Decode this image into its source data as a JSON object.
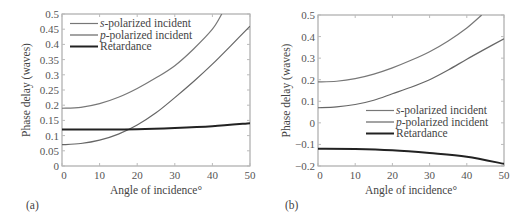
{
  "chart_data": [
    {
      "type": "line",
      "panel_label": "(a)",
      "title": "",
      "xlabel": "Angle of incidence°",
      "ylabel": "Phase delay (waves)",
      "xlim": [
        0,
        50
      ],
      "ylim": [
        0,
        0.5
      ],
      "xticks": [
        0,
        10,
        20,
        30,
        40,
        50
      ],
      "yticks": [
        0,
        0.05,
        0.1,
        0.15,
        0.2,
        0.25,
        0.3,
        0.35,
        0.4,
        0.45,
        0.5
      ],
      "ytick_labels": [
        "0",
        "0.05",
        "0.1",
        "0.15",
        "0.2",
        "0.25",
        "0.3",
        "0.35",
        "0.4",
        "0.45",
        "0.5"
      ],
      "legend_position": "upper left",
      "grid": false,
      "series": [
        {
          "name": "s-polarized incident",
          "italic_prefix": "s",
          "suffix": "-polarized incident",
          "color": "#777777",
          "width": 1.2,
          "x": [
            0,
            5,
            10,
            15,
            20,
            25,
            30,
            35,
            40,
            42.5
          ],
          "y": [
            0.19,
            0.193,
            0.205,
            0.226,
            0.255,
            0.29,
            0.33,
            0.385,
            0.45,
            0.5
          ]
        },
        {
          "name": "p-polarized incident",
          "italic_prefix": "p",
          "suffix": "-polarized incident",
          "color": "#666666",
          "width": 1.2,
          "x": [
            0,
            5,
            10,
            15,
            20,
            25,
            30,
            35,
            40,
            45,
            50
          ],
          "y": [
            0.07,
            0.074,
            0.085,
            0.105,
            0.135,
            0.175,
            0.225,
            0.278,
            0.335,
            0.397,
            0.46
          ]
        },
        {
          "name": "Retardance",
          "italic_prefix": "",
          "suffix": "Retardance",
          "color": "#222222",
          "width": 2,
          "x": [
            0,
            10,
            20,
            30,
            40,
            50
          ],
          "y": [
            0.12,
            0.12,
            0.121,
            0.125,
            0.131,
            0.141
          ]
        }
      ]
    },
    {
      "type": "line",
      "panel_label": "(b)",
      "title": "",
      "xlabel": "Angle of incidence°",
      "ylabel": "Phase delay (waves)",
      "xlim": [
        0,
        50
      ],
      "ylim": [
        -0.2,
        0.5
      ],
      "xticks": [
        0,
        10,
        20,
        30,
        40,
        50
      ],
      "yticks": [
        -0.2,
        -0.1,
        0,
        0.1,
        0.2,
        0.3,
        0.4,
        0.5
      ],
      "ytick_labels": [
        "−0.2",
        "−0.1",
        "0",
        "0.1",
        "0.2",
        "0.3",
        "0.4",
        "0.5"
      ],
      "legend_position": "lower right",
      "grid": false,
      "series": [
        {
          "name": "s-polarized incident",
          "italic_prefix": "s",
          "suffix": "-polarized incident",
          "color": "#777777",
          "width": 1.2,
          "x": [
            0,
            5,
            10,
            15,
            20,
            25,
            30,
            35,
            40,
            44
          ],
          "y": [
            0.19,
            0.193,
            0.205,
            0.226,
            0.255,
            0.29,
            0.33,
            0.38,
            0.44,
            0.5
          ]
        },
        {
          "name": "p-polarized incident",
          "italic_prefix": "p",
          "suffix": "-polarized incident",
          "color": "#666666",
          "width": 1.2,
          "x": [
            0,
            5,
            10,
            15,
            20,
            25,
            30,
            35,
            40,
            45,
            50
          ],
          "y": [
            0.07,
            0.074,
            0.085,
            0.105,
            0.135,
            0.165,
            0.2,
            0.245,
            0.295,
            0.343,
            0.39
          ]
        },
        {
          "name": "Retardance",
          "italic_prefix": "",
          "suffix": "Retardance",
          "color": "#222222",
          "width": 2,
          "x": [
            0,
            10,
            20,
            30,
            40,
            50
          ],
          "y": [
            -0.12,
            -0.121,
            -0.127,
            -0.14,
            -0.157,
            -0.19
          ]
        }
      ]
    }
  ]
}
